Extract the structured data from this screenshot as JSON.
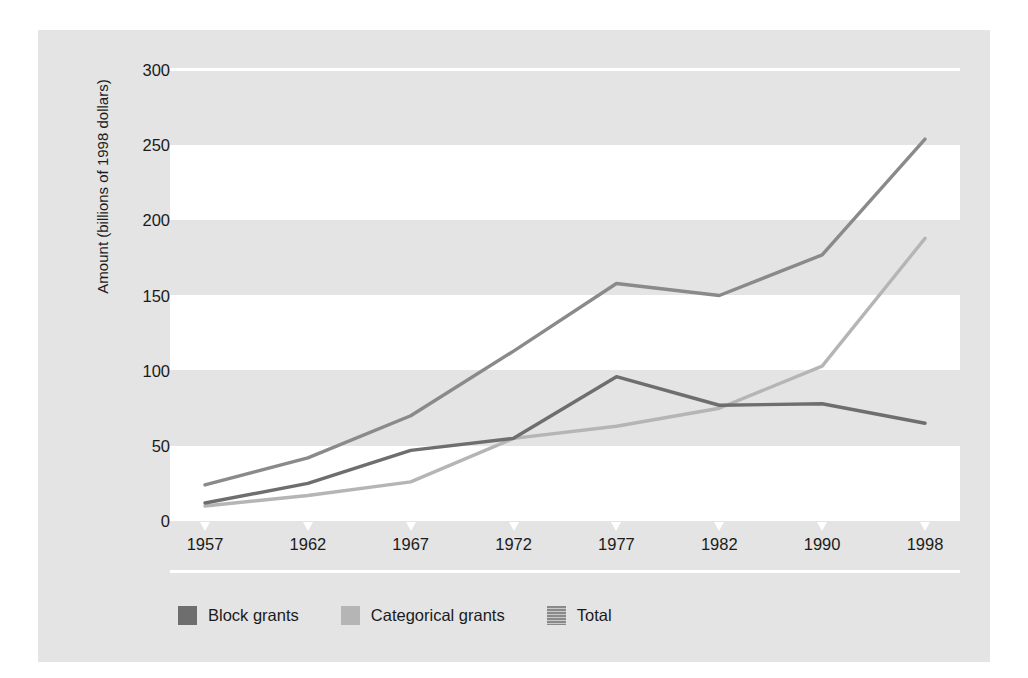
{
  "chart_data": {
    "type": "line",
    "title": "",
    "xlabel": "",
    "ylabel": "Amount (billions of 1998 dollars)",
    "categories": [
      "1957",
      "1962",
      "1967",
      "1972",
      "1977",
      "1982",
      "1990",
      "1998"
    ],
    "ylim": [
      0,
      300
    ],
    "yticks": [
      0,
      50,
      100,
      150,
      200,
      250,
      300
    ],
    "ytick_labels": [
      "0",
      "50",
      "100",
      "150",
      "200",
      "250",
      "300"
    ],
    "grid": "alternating horizontal bands",
    "legend_position": "bottom-left",
    "series": [
      {
        "name": "Block grants",
        "color": "#6e6e6e",
        "values": [
          12,
          25,
          47,
          55,
          96,
          77,
          78,
          65
        ]
      },
      {
        "name": "Categorical grants",
        "color": "#b5b5b5",
        "values": [
          10,
          17,
          26,
          55,
          63,
          75,
          103,
          188
        ]
      },
      {
        "name": "Total",
        "color": "#8a8a8a",
        "values": [
          24,
          42,
          70,
          113,
          158,
          150,
          177,
          254
        ]
      }
    ]
  },
  "legend": {
    "items": [
      {
        "label": "Block grants",
        "swatch": "#6e6e6e",
        "texture": "solid"
      },
      {
        "label": "Categorical grants",
        "swatch": "#b5b5b5",
        "texture": "solid"
      },
      {
        "label": "Total",
        "swatch": "#8a8a8a",
        "texture": "striped"
      }
    ]
  },
  "colors": {
    "panel_background": "#e4e4e4",
    "band_highlight": "#ffffff",
    "figure_background": "#ffffff",
    "text": "#1b1b1b"
  }
}
